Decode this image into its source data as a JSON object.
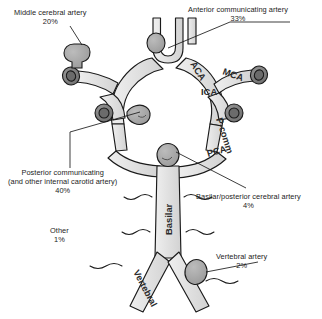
{
  "figure": {
    "colors": {
      "vessel_fill": "#e0e0e0",
      "vessel_fill_light": "#ebebeb",
      "vessel_stroke": "#1a1a1a",
      "aneurysm_fill": "#a8a8a8",
      "stump_outer": "#bdbdbd",
      "stump_inner": "#8a8a8a",
      "leader_line": "#1a1a1a",
      "background": "#ffffff"
    }
  },
  "callouts": [
    {
      "id": "mca",
      "name": "Middle cerebral artery",
      "percent": "20%"
    },
    {
      "id": "acomm",
      "name": "Anterior communicating artery",
      "percent": "33%"
    },
    {
      "id": "pcomm",
      "name": "Posterior communicating",
      "name2": "(and other internal carotid artery)",
      "percent": "40%"
    },
    {
      "id": "basilar",
      "name": "Basilar/posterior cerebral artery",
      "percent": "4%"
    },
    {
      "id": "vertebral",
      "name": "Vertebral artery",
      "percent": "2%"
    },
    {
      "id": "other",
      "name": "Other",
      "percent": "1%"
    }
  ],
  "vessel_labels": [
    {
      "id": "aca",
      "text": "ACA"
    },
    {
      "id": "mca",
      "text": "MCA"
    },
    {
      "id": "ica",
      "text": "ICA"
    },
    {
      "id": "pcomm",
      "text": "P-comm"
    },
    {
      "id": "pca",
      "text": "PCA"
    },
    {
      "id": "basilar",
      "text": "Basilar"
    },
    {
      "id": "vertebral",
      "text": "Vertebral"
    }
  ]
}
